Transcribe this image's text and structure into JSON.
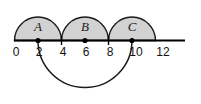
{
  "figure": {
    "title": "",
    "axis": {
      "label": "number-line",
      "min": 0,
      "max": 12,
      "tick_values": [
        0,
        2,
        4,
        6,
        8,
        10,
        12
      ],
      "tick_labels": [
        "0",
        "2",
        "4",
        "6",
        "8",
        "10",
        "12"
      ],
      "tick_marks_at": [
        4,
        8
      ],
      "line_color": "#000000"
    },
    "semicircles": [
      {
        "label": "A",
        "start": 0,
        "end": 4,
        "center": 2,
        "radius": 2,
        "side": "above",
        "fill": "#d2d2d2",
        "stroke": "#000000"
      },
      {
        "label": "B",
        "start": 4,
        "end": 8,
        "center": 6,
        "radius": 2,
        "side": "above",
        "fill": "#d2d2d2",
        "stroke": "#000000"
      },
      {
        "label": "C",
        "start": 8,
        "end": 12,
        "center": 10,
        "radius": 2,
        "side": "above",
        "fill": "#d2d2d2",
        "stroke": "#000000"
      }
    ],
    "lower_arc": {
      "label": "large-arc",
      "start": 2,
      "end": 10,
      "center": 6,
      "radius": 4,
      "side": "below",
      "fill": "none",
      "stroke": "#000000"
    },
    "points": [
      {
        "label": "point-2",
        "value": 2,
        "on": "axis"
      },
      {
        "label": "point-6",
        "value": 6,
        "on": "axis"
      },
      {
        "label": "point-10",
        "value": 10,
        "on": "axis"
      }
    ],
    "colors": {
      "shade": "#d2d2d2",
      "stroke": "#000000",
      "background": "#ffffff",
      "text": "#111111"
    }
  }
}
